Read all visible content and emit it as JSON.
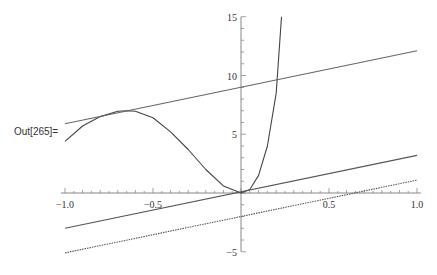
{
  "cell": {
    "output_label": "Out[265]="
  },
  "chart_data": {
    "type": "line",
    "title": "",
    "xlabel": "",
    "ylabel": "",
    "xlim": [
      -1.0,
      1.0
    ],
    "ylim": [
      -5,
      15
    ],
    "grid": false,
    "legend": null,
    "x_ticks": [
      "-1.0",
      "-0.5",
      "0.5",
      "1.0"
    ],
    "y_ticks": [
      "-5",
      "5",
      "10",
      "15"
    ],
    "series": [
      {
        "name": "curve",
        "style": "solid",
        "color": "#444444",
        "x": [
          -1.0,
          -0.9,
          -0.8,
          -0.7,
          -0.65,
          -0.6,
          -0.5,
          -0.4,
          -0.3,
          -0.2,
          -0.1,
          0.0,
          0.05,
          0.1,
          0.15,
          0.2,
          0.23
        ],
        "y": [
          4.4,
          5.7,
          6.5,
          6.95,
          7.0,
          6.95,
          6.4,
          5.2,
          3.7,
          2.0,
          0.6,
          0.0,
          0.3,
          1.5,
          4.0,
          8.5,
          15.0
        ]
      },
      {
        "name": "tangent-line-upper",
        "style": "solid",
        "color": "#666666",
        "x": [
          -1.0,
          1.0
        ],
        "y": [
          5.9,
          12.1
        ]
      },
      {
        "name": "line-through-origin",
        "style": "solid",
        "color": "#555555",
        "x": [
          -1.0,
          1.0
        ],
        "y": [
          -3.0,
          3.2
        ]
      },
      {
        "name": "line-dotted",
        "style": "dotted",
        "color": "#555555",
        "x": [
          -1.0,
          1.0
        ],
        "y": [
          -5.1,
          1.1
        ]
      }
    ]
  }
}
